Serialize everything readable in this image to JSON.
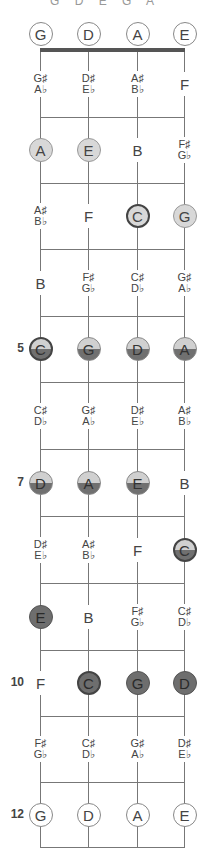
{
  "title": "G D E G A",
  "strings": [
    "G",
    "D",
    "A",
    "E"
  ],
  "fret_markers": [
    {
      "fret": 5,
      "label": "5"
    },
    {
      "fret": 7,
      "label": "7"
    },
    {
      "fret": 10,
      "label": "10"
    },
    {
      "fret": 12,
      "label": "12"
    }
  ],
  "colors": {
    "string": "#777777",
    "light_fill": "#d8d8d8",
    "half_top": "#d0d0d0",
    "half_bottom": "#707070",
    "dark_fill": "#6e6e6e",
    "root_border": "#444444"
  },
  "frets": [
    {
      "fret": 0,
      "notes": [
        {
          "label": "G",
          "style": "open"
        },
        {
          "label": "D",
          "style": "open"
        },
        {
          "label": "A",
          "style": "open"
        },
        {
          "label": "E",
          "style": "open"
        }
      ]
    },
    {
      "fret": 1,
      "notes": [
        {
          "label": "G♯",
          "alt": "A♭",
          "style": "acc"
        },
        {
          "label": "D♯",
          "alt": "E♭",
          "style": "acc"
        },
        {
          "label": "A♯",
          "alt": "B♭",
          "style": "acc"
        },
        {
          "label": "F",
          "style": "plain"
        }
      ]
    },
    {
      "fret": 2,
      "notes": [
        {
          "label": "A",
          "style": "light"
        },
        {
          "label": "E",
          "style": "light"
        },
        {
          "label": "B",
          "style": "plain"
        },
        {
          "label": "F♯",
          "alt": "G♭",
          "style": "acc"
        }
      ]
    },
    {
      "fret": 3,
      "notes": [
        {
          "label": "A♯",
          "alt": "B♭",
          "style": "acc"
        },
        {
          "label": "F",
          "style": "plain"
        },
        {
          "label": "C",
          "style": "light root"
        },
        {
          "label": "G",
          "style": "light"
        }
      ]
    },
    {
      "fret": 4,
      "notes": [
        {
          "label": "B",
          "style": "plain"
        },
        {
          "label": "F♯",
          "alt": "G♭",
          "style": "acc"
        },
        {
          "label": "C♯",
          "alt": "D♭",
          "style": "acc"
        },
        {
          "label": "G♯",
          "alt": "A♭",
          "style": "acc"
        }
      ]
    },
    {
      "fret": 5,
      "notes": [
        {
          "label": "C",
          "style": "half root"
        },
        {
          "label": "G",
          "style": "half"
        },
        {
          "label": "D",
          "style": "half"
        },
        {
          "label": "A",
          "style": "half"
        }
      ]
    },
    {
      "fret": 6,
      "notes": [
        {
          "label": "C♯",
          "alt": "D♭",
          "style": "acc"
        },
        {
          "label": "G♯",
          "alt": "A♭",
          "style": "acc"
        },
        {
          "label": "D♯",
          "alt": "E♭",
          "style": "acc"
        },
        {
          "label": "A♯",
          "alt": "B♭",
          "style": "acc"
        }
      ]
    },
    {
      "fret": 7,
      "notes": [
        {
          "label": "D",
          "style": "half"
        },
        {
          "label": "A",
          "style": "half"
        },
        {
          "label": "E",
          "style": "half"
        },
        {
          "label": "B",
          "style": "plain"
        }
      ]
    },
    {
      "fret": 8,
      "notes": [
        {
          "label": "D♯",
          "alt": "E♭",
          "style": "acc"
        },
        {
          "label": "A♯",
          "alt": "B♭",
          "style": "acc"
        },
        {
          "label": "F",
          "style": "plain"
        },
        {
          "label": "C",
          "style": "half root"
        }
      ]
    },
    {
      "fret": 9,
      "notes": [
        {
          "label": "E",
          "style": "dark"
        },
        {
          "label": "B",
          "style": "plain"
        },
        {
          "label": "F♯",
          "alt": "G♭",
          "style": "acc"
        },
        {
          "label": "C♯",
          "alt": "D♭",
          "style": "acc"
        }
      ]
    },
    {
      "fret": 10,
      "notes": [
        {
          "label": "F",
          "style": "plain"
        },
        {
          "label": "C",
          "style": "dark root"
        },
        {
          "label": "G",
          "style": "dark"
        },
        {
          "label": "D",
          "style": "dark"
        }
      ]
    },
    {
      "fret": 11,
      "notes": [
        {
          "label": "F♯",
          "alt": "G♭",
          "style": "acc"
        },
        {
          "label": "C♯",
          "alt": "D♭",
          "style": "acc"
        },
        {
          "label": "G♯",
          "alt": "A♭",
          "style": "acc"
        },
        {
          "label": "D♯",
          "alt": "E♭",
          "style": "acc"
        }
      ]
    },
    {
      "fret": 12,
      "notes": [
        {
          "label": "G",
          "style": "open"
        },
        {
          "label": "D",
          "style": "open"
        },
        {
          "label": "A",
          "style": "open"
        },
        {
          "label": "E",
          "style": "open"
        }
      ]
    }
  ]
}
